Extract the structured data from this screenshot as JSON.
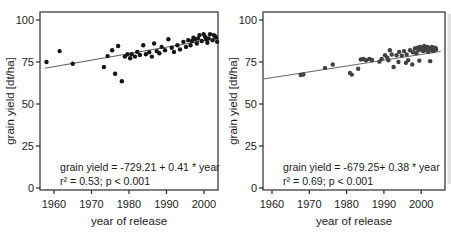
{
  "figure": {
    "background_color": "#ffffff",
    "frame_color": "#2b2b2b",
    "text_color": "#1c1c1c"
  },
  "chart_data": [
    {
      "type": "scatter",
      "panel": "left",
      "xlabel": "year of release",
      "ylabel": "grain yield [dt/ha]",
      "xticks": [
        1960,
        1970,
        1980,
        1990,
        2000
      ],
      "yticks": [
        0,
        25,
        50,
        75,
        100
      ],
      "xlim": [
        1956.3,
        2003.7
      ],
      "ylim": [
        0,
        100
      ],
      "grid": false,
      "legend": "none",
      "point_color": "#161616",
      "line_color": "#4a4a4a",
      "annotation": {
        "line1": "grain yield = -729.21 + 0.41 * year",
        "line2": "r² = 0.53; p < 0.001"
      },
      "fit": {
        "intercept": -729.21,
        "slope": 0.41,
        "r_squared": 0.53,
        "p": "< 0.001"
      },
      "trendline": {
        "x1": 1957.6,
        "y1": 71.3,
        "x2": 2002.8,
        "y2": 88.8
      },
      "points": [
        [
          1958,
          75
        ],
        [
          1961.5,
          81.5
        ],
        [
          1965,
          74
        ],
        [
          1973.3,
          72
        ],
        [
          1974.3,
          78.5
        ],
        [
          1975.5,
          82
        ],
        [
          1976.3,
          68
        ],
        [
          1977.1,
          84.5
        ],
        [
          1978.1,
          63.5
        ],
        [
          1978.9,
          78.2
        ],
        [
          1979.6,
          79.6
        ],
        [
          1980.3,
          77.2
        ],
        [
          1980.7,
          79.6
        ],
        [
          1981.6,
          78.2
        ],
        [
          1982.2,
          81
        ],
        [
          1982.9,
          79.2
        ],
        [
          1983.8,
          85
        ],
        [
          1984.5,
          79.6
        ],
        [
          1985.4,
          80.8
        ],
        [
          1986.1,
          78.2
        ],
        [
          1986.7,
          86
        ],
        [
          1987.4,
          81.5
        ],
        [
          1988.1,
          80.2
        ],
        [
          1988.7,
          84
        ],
        [
          1989.6,
          82
        ],
        [
          1990.5,
          88.5
        ],
        [
          1991.4,
          83.5
        ],
        [
          1992,
          81
        ],
        [
          1992.9,
          85
        ],
        [
          1993.6,
          82.5
        ],
        [
          1994.5,
          87
        ],
        [
          1995.2,
          84
        ],
        [
          1995.8,
          88
        ],
        [
          1996.4,
          85
        ],
        [
          1996.8,
          87.5
        ],
        [
          1997.2,
          89.5
        ],
        [
          1997.6,
          88.5
        ],
        [
          1998.1,
          86
        ],
        [
          1998.4,
          89
        ],
        [
          1998.8,
          91
        ],
        [
          1999.4,
          87.5
        ],
        [
          1999.9,
          91.5
        ],
        [
          2000.3,
          90
        ],
        [
          2000.6,
          88.5
        ],
        [
          2000.9,
          86.5
        ],
        [
          2001.2,
          89
        ],
        [
          2001.6,
          91.5
        ],
        [
          2002.3,
          88
        ],
        [
          2002.6,
          91
        ],
        [
          2002.9,
          90.5
        ],
        [
          2003.2,
          89.5
        ],
        [
          2003.5,
          87
        ]
      ]
    },
    {
      "type": "scatter",
      "panel": "right",
      "xlabel": "year of release",
      "ylabel": "grain yield [dt/ha]",
      "xticks": [
        1960,
        1970,
        1980,
        1990,
        2000
      ],
      "yticks": [
        0,
        25,
        50,
        75,
        100
      ],
      "xlim": [
        1957.6,
        2006.4
      ],
      "ylim": [
        0,
        100
      ],
      "grid": false,
      "legend": "none",
      "point_color": "#414141",
      "line_color": "#555555",
      "annotation": {
        "line1": "grain yield = -679.25+ 0.38 * year",
        "line2": "r² = 0.69; p < 0.001"
      },
      "fit": {
        "intercept": -679.25,
        "slope": 0.38,
        "r_squared": 0.69,
        "p": "< 0.001"
      },
      "trendline": {
        "x1": 1957.7,
        "y1": 64.9,
        "x2": 2005.2,
        "y2": 81.3
      },
      "points": [
        [
          1967.7,
          67.3
        ],
        [
          1968.4,
          67.6
        ],
        [
          1974.2,
          71.5
        ],
        [
          1976.3,
          73.5
        ],
        [
          1980.9,
          68.5
        ],
        [
          1981.4,
          67.5
        ],
        [
          1983.1,
          71
        ],
        [
          1983.8,
          76.5
        ],
        [
          1984.5,
          76.8
        ],
        [
          1985.2,
          76
        ],
        [
          1986.1,
          76.8
        ],
        [
          1986.8,
          76.2
        ],
        [
          1988.8,
          75.2
        ],
        [
          1989.4,
          76.8
        ],
        [
          1990.3,
          79
        ],
        [
          1990.9,
          77.5
        ],
        [
          1991.2,
          76
        ],
        [
          1991.6,
          82
        ],
        [
          1992.1,
          79.5
        ],
        [
          1992.6,
          72
        ],
        [
          1993.4,
          79
        ],
        [
          1993.9,
          75
        ],
        [
          1994.1,
          81
        ],
        [
          1994.8,
          78.8
        ],
        [
          1995.4,
          81.5
        ],
        [
          1995.9,
          74.5
        ],
        [
          1996.1,
          79.5
        ],
        [
          1996.5,
          76
        ],
        [
          1997,
          82
        ],
        [
          1997.6,
          73.5
        ],
        [
          1997.8,
          80.8
        ],
        [
          1998.3,
          83
        ],
        [
          1998.7,
          80.2
        ],
        [
          1999,
          83.5
        ],
        [
          1999.3,
          82
        ],
        [
          1999.5,
          75.8
        ],
        [
          1999.7,
          84
        ],
        [
          2000,
          82.5
        ],
        [
          2000.2,
          83.5
        ],
        [
          2000.5,
          81.5
        ],
        [
          2000.8,
          84.5
        ],
        [
          2001,
          82
        ],
        [
          2001.3,
          83
        ],
        [
          2001.6,
          84
        ],
        [
          2001.9,
          81
        ],
        [
          2002.2,
          83.5
        ],
        [
          2002.4,
          75.5
        ],
        [
          2002.6,
          82.5
        ],
        [
          2002.9,
          84
        ],
        [
          2003.1,
          81.5
        ],
        [
          2003.3,
          83
        ],
        [
          2003.6,
          82
        ],
        [
          2003.8,
          83.5
        ],
        [
          2004,
          82.5
        ]
      ]
    }
  ]
}
